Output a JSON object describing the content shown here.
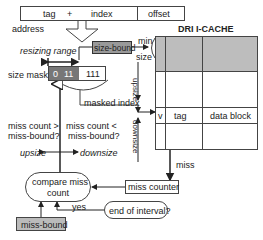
{
  "address": {
    "fields": [
      "tag",
      "+",
      "index",
      "offset"
    ],
    "label": "address"
  },
  "resizing_range": "resizing range",
  "size_bound": "size-bound",
  "min_size": {
    "min": "min",
    "size": "size"
  },
  "size_mask": {
    "label": "size mask:",
    "bits": [
      "0",
      "11",
      "111"
    ]
  },
  "masked_index": "masked index",
  "cache": {
    "title": "DRI I-CACHE",
    "columns": [
      "v",
      "tag",
      "data block"
    ],
    "upsize": "upsize",
    "downsize": "downsize"
  },
  "miss": "miss",
  "conditions": {
    "gt": [
      "miss count >",
      "miss-bound?"
    ],
    "lt": [
      "miss count <",
      "miss-bound?"
    ]
  },
  "actions": {
    "upsize": "upsize",
    "downsize": "downsize"
  },
  "compare": [
    "compare miss",
    "count"
  ],
  "miss_counter": "miss counter",
  "end_of_interval": "end of interval?",
  "yes": "yes",
  "miss_bound": "miss-bound",
  "colors": {
    "shaded": "#bdbdbd",
    "dark_mask": "#777777",
    "line": "#333333"
  }
}
